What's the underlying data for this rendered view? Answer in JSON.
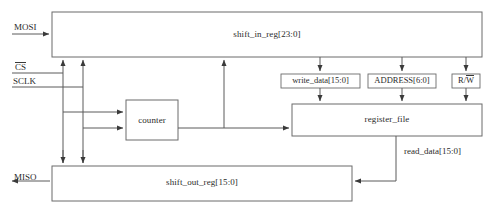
{
  "figure": {
    "type": "block-diagram",
    "caption": ""
  },
  "blocks": [
    {
      "id": "shift_in_reg",
      "label": "shift_in_reg[23:0]",
      "x": 52,
      "y": 12,
      "w": 430,
      "h": 45
    },
    {
      "id": "counter",
      "label": "counter",
      "x": 126,
      "y": 100,
      "w": 52,
      "h": 40
    },
    {
      "id": "register_file",
      "label": "register_file",
      "x": 292,
      "y": 104,
      "w": 190,
      "h": 32
    },
    {
      "id": "shift_out_reg",
      "label": "shift_out_reg[15:0]",
      "x": 52,
      "y": 166,
      "w": 300,
      "h": 35
    }
  ],
  "taps": [
    {
      "id": "write_data",
      "label": "write_data[15:0]",
      "x": 281,
      "y": 74,
      "w": 79,
      "h": 14
    },
    {
      "id": "address",
      "label": "ADDRESS[6:0]",
      "x": 368,
      "y": 74,
      "w": 68,
      "h": 14
    },
    {
      "id": "rw",
      "label_before": "R/",
      "label_over": "W",
      "x": 452,
      "y": 74,
      "w": 28,
      "h": 14
    }
  ],
  "signals": {
    "mosi": {
      "label": "MOSI",
      "x": 14,
      "y": 26
    },
    "cs": {
      "label": "CS",
      "x": 15,
      "y": 66,
      "overlined": true
    },
    "sclk": {
      "label": "SCLK",
      "x": 13,
      "y": 80
    },
    "miso": {
      "label": "MISO",
      "x": 14,
      "y": 176
    },
    "read_data": {
      "label": "read_data[15:0]",
      "x": 404,
      "y": 150
    }
  },
  "colors": {
    "stroke": "#5a5a5a",
    "box_stroke": "#6b6b6b",
    "text": "#2b2b2b",
    "background": "#ffffff"
  }
}
